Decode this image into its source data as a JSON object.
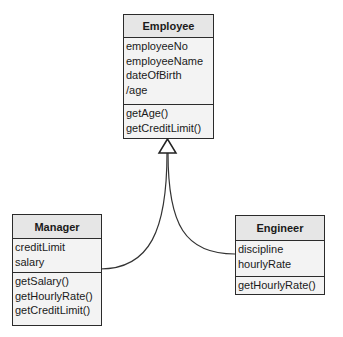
{
  "classes": {
    "employee": {
      "name": "Employee",
      "attributes": [
        "employeeNo",
        "employeeName",
        "dateOfBirth",
        "/age"
      ],
      "methods": [
        "getAge()",
        "getCreditLimit()"
      ]
    },
    "manager": {
      "name": "Manager",
      "attributes": [
        "creditLimit",
        "salary"
      ],
      "methods": [
        "getSalary()",
        "getHourlyRate()",
        "getCreditLimit()"
      ]
    },
    "engineer": {
      "name": "Engineer",
      "attributes": [
        "discipline",
        "hourlyRate"
      ],
      "methods": [
        "getHourlyRate()"
      ]
    }
  },
  "relationships": [
    {
      "type": "generalization",
      "from": "Manager",
      "to": "Employee"
    },
    {
      "type": "generalization",
      "from": "Engineer",
      "to": "Employee"
    }
  ]
}
